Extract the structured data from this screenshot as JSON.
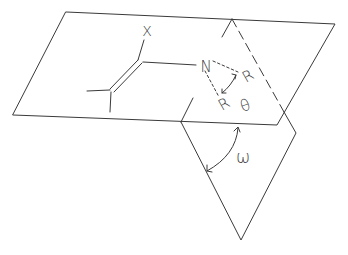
{
  "diagram": {
    "type": "geometry-planes-molecule",
    "labels": {
      "substituent": "X",
      "nitrogen": "N",
      "r_upper": "R",
      "r_lower": "R",
      "theta": "θ",
      "omega": "ω"
    },
    "colors": {
      "stroke": "#3a3a3a",
      "background": "#ffffff"
    }
  }
}
